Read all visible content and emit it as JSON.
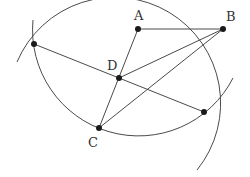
{
  "diagram": {
    "type": "geometric-construction",
    "points": {
      "A": {
        "label": "A",
        "x": 138,
        "y": 29,
        "label_x": 134,
        "label_y": 20
      },
      "B": {
        "label": "B",
        "x": 223,
        "y": 29,
        "label_x": 226,
        "label_y": 21
      },
      "C": {
        "label": "C",
        "x": 99,
        "y": 128,
        "label_x": 88,
        "label_y": 147
      },
      "D": {
        "label": "D",
        "x": 119,
        "y": 78,
        "label_x": 107,
        "label_y": 70
      },
      "P1": {
        "label": "",
        "x": 34,
        "y": 44
      },
      "P2": {
        "label": "",
        "x": 204,
        "y": 112
      }
    },
    "segments": [
      [
        "A",
        "B"
      ],
      [
        "A",
        "C"
      ],
      [
        "B",
        "D"
      ],
      [
        "B",
        "C"
      ],
      [
        "P1",
        "P2"
      ]
    ],
    "arcs": [
      {
        "center": "C",
        "radius": 106,
        "description": "arc centered at C through P1, A, P2"
      },
      {
        "center": "A",
        "radius": 106,
        "description": "arc centered at A through P1, C, P2"
      }
    ],
    "colors": {
      "stroke": "#4a4a4a",
      "point": "#1a1a1a",
      "label": "#333333"
    }
  }
}
